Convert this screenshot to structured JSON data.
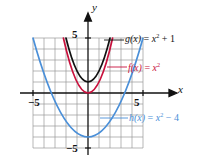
{
  "figure": {
    "kind": "cartesian-graph",
    "background": "#ffffff"
  },
  "axes": {
    "x_label": "x",
    "y_label": "y",
    "ticks": {
      "x_negative": "−5",
      "x_positive": "5",
      "y_positive": "5",
      "y_negative": "−5"
    },
    "xlim": [
      -5,
      5
    ],
    "ylim": [
      -5,
      5
    ],
    "grid": true,
    "grid_color": "#9a9a9a",
    "axis_color": "#111111"
  },
  "curves": [
    {
      "id": "g",
      "name": "g(x)",
      "label_html": "g(x)<span class=\"op\"> = </span>x<span class=\"up\">2</span><span class=\"op\"> + 1</span>",
      "expression": "x^2 + 1",
      "color": "#111111",
      "vertex": [
        0,
        1
      ]
    },
    {
      "id": "f",
      "name": "f(x)",
      "label_html": "f(x)<span class=\"op\"> = </span>x<span class=\"up\">2</span>",
      "expression": "x^2",
      "color": "#c8103c",
      "vertex": [
        0,
        0
      ]
    },
    {
      "id": "h",
      "name": "h(x)",
      "label_html": "h(x)<span class=\"op\"> = </span>x<span class=\"up\">2</span><span class=\"op\"> − 4</span>",
      "expression": "x^2 - 4",
      "color": "#4a8fd8",
      "vertex": [
        0,
        -4
      ]
    }
  ],
  "chart_data": {
    "type": "line",
    "title": "",
    "xlabel": "x",
    "ylabel": "y",
    "xlim": [
      -5,
      5
    ],
    "ylim": [
      -5,
      5
    ],
    "grid": true,
    "legend_position": "inline-annotations",
    "xticks": [
      -5,
      5
    ],
    "yticks": [
      -5,
      5
    ],
    "xticklabels": [
      "−5",
      "5"
    ],
    "yticklabels": [
      "−5",
      "5"
    ],
    "series": [
      {
        "name": "g(x) = x^2 + 1",
        "color": "#111111",
        "x": [
          -2.0,
          -1.75,
          -1.5,
          -1.25,
          -1.0,
          -0.75,
          -0.5,
          -0.25,
          0,
          0.25,
          0.5,
          0.75,
          1.0,
          1.25,
          1.5,
          1.75,
          2.0
        ],
        "y": [
          5.0,
          4.0625,
          3.25,
          2.5625,
          2.0,
          1.5625,
          1.25,
          1.0625,
          1.0,
          1.0625,
          1.25,
          1.5625,
          2.0,
          2.5625,
          3.25,
          4.0625,
          5.0
        ]
      },
      {
        "name": "f(x) = x^2",
        "color": "#c8103c",
        "x": [
          -2.236,
          -2.0,
          -1.75,
          -1.5,
          -1.25,
          -1.0,
          -0.75,
          -0.5,
          -0.25,
          0,
          0.25,
          0.5,
          0.75,
          1.0,
          1.25,
          1.5,
          1.75,
          2.0,
          2.236
        ],
        "y": [
          5.0,
          4.0,
          3.0625,
          2.25,
          1.5625,
          1.0,
          0.5625,
          0.25,
          0.0625,
          0,
          0.0625,
          0.25,
          0.5625,
          1.0,
          1.5625,
          2.25,
          3.0625,
          4.0,
          5.0
        ]
      },
      {
        "name": "h(x) = x^2 - 4",
        "color": "#4a8fd8",
        "x": [
          -3.0,
          -2.75,
          -2.5,
          -2.25,
          -2.0,
          -1.75,
          -1.5,
          -1.25,
          -1.0,
          -0.75,
          -0.5,
          -0.25,
          0,
          0.25,
          0.5,
          0.75,
          1.0,
          1.25,
          1.5,
          1.75,
          2.0,
          2.25,
          2.5,
          2.75,
          3.0
        ],
        "y": [
          5.0,
          3.5625,
          2.25,
          1.0625,
          0.0,
          -0.9375,
          -1.75,
          -2.4375,
          -3.0,
          -3.4375,
          -3.75,
          -3.9375,
          -4.0,
          -3.9375,
          -3.75,
          -3.4375,
          -3.0,
          -2.4375,
          -1.75,
          -0.9375,
          0.0,
          1.0625,
          2.25,
          3.5625,
          5.0
        ]
      }
    ]
  }
}
